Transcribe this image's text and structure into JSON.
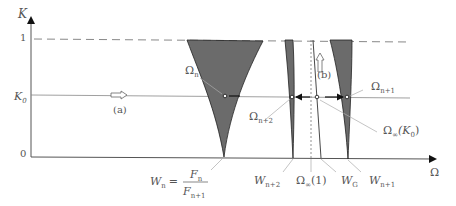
{
  "axes": {
    "y_label": "K",
    "x_label": "Ω",
    "y_ticks": [
      "1",
      "K0",
      "0"
    ],
    "y_tick_1": "1",
    "y_tick_k0_main": "K",
    "y_tick_k0_sub": "0",
    "y_tick_0": "0"
  },
  "annotations": {
    "arrow_a": "(a)",
    "arrow_b": "(b)",
    "omega_n": "Ω",
    "omega_n_sub": "n",
    "omega_n1": "Ω",
    "omega_n1_sub": "n+1",
    "omega_n2": "Ω",
    "omega_n2_sub": "n+2",
    "omega_inf_k0": "Ω",
    "omega_inf_k0_sub": "∞",
    "omega_inf_k0_arg": "(K",
    "omega_inf_k0_arg_sub": "0",
    "omega_inf_k0_close": ")"
  },
  "x_labels": {
    "wn_lhs": "W",
    "wn_lhs_sub": "n",
    "wn_eq": "=",
    "wn_num": "F",
    "wn_num_sub": "n",
    "wn_den": "F",
    "wn_den_sub": "n+1",
    "wn2": "W",
    "wn2_sub": "n+2",
    "omega_inf_1": "Ω",
    "omega_inf_1_sub": "∞",
    "omega_inf_1_arg": "(1)",
    "wg": "W",
    "wg_sub": "G",
    "wn1": "W",
    "wn1_sub": "n+1"
  },
  "colors": {
    "tongue_fill": "#6b6b6b",
    "axis": "#444444",
    "guide": "#999999",
    "text": "#555555"
  }
}
